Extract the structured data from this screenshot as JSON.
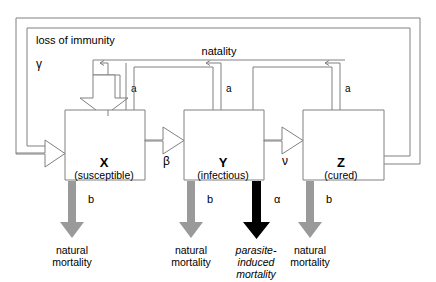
{
  "diagram": {
    "colors": {
      "outline": "#808080",
      "line": "#808080",
      "gray_arrow": "#9a9a9a",
      "black_arrow": "#000000",
      "text": "#000000",
      "background": "#ffffff"
    },
    "frame": {
      "outer_label": "loss of immunity",
      "outer_rate": "γ",
      "natality_label": "natality",
      "natality_rate": "a"
    },
    "compartments": [
      {
        "id": "X",
        "symbol": "X",
        "state": "(susceptible)"
      },
      {
        "id": "Y",
        "symbol": "Y",
        "state": "(infectious)"
      },
      {
        "id": "Z",
        "symbol": "Z",
        "state": "(cured)"
      }
    ],
    "transitions": [
      {
        "from": "X",
        "to": "Y",
        "rate": "β"
      },
      {
        "from": "Y",
        "to": "Z",
        "rate": "ν"
      }
    ],
    "natality_rates": [
      "a",
      "a",
      "a"
    ],
    "outflows": [
      {
        "from": "X",
        "rate": "b",
        "label_lines": [
          "natural",
          "mortality"
        ],
        "style": "gray",
        "italic": false
      },
      {
        "from": "Y",
        "rate": "b",
        "label_lines": [
          "natural",
          "mortality"
        ],
        "style": "gray",
        "italic": false
      },
      {
        "from": "Y",
        "rate": "α",
        "label_lines": [
          "parasite-",
          "induced",
          "mortality"
        ],
        "style": "black",
        "italic": true
      },
      {
        "from": "Z",
        "rate": "b",
        "label_lines": [
          "natural",
          "mortality"
        ],
        "style": "gray",
        "italic": false
      }
    ]
  }
}
